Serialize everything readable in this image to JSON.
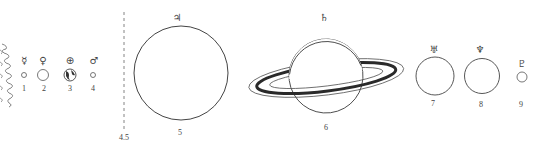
{
  "diagram": {
    "title": "",
    "sun": {
      "edge": "wavy-flame"
    },
    "boundary": {
      "label": "4.5",
      "style": "dashed-vertical"
    },
    "planets": [
      {
        "number": "1",
        "symbol": "☿",
        "name": "Mercury",
        "cx": 24,
        "cy": 75,
        "r": 2.5
      },
      {
        "number": "2",
        "symbol": "♀",
        "name": "Venus",
        "cx": 43,
        "cy": 75,
        "r": 5.5
      },
      {
        "number": "3",
        "symbol": "⊕",
        "name": "Earth",
        "cx": 70,
        "cy": 75,
        "r": 6
      },
      {
        "number": "4",
        "symbol": "♂",
        "name": "Mars",
        "cx": 93,
        "cy": 75,
        "r": 2.5
      },
      {
        "number": "5",
        "symbol": "♃",
        "name": "Jupiter",
        "cx": 181,
        "cy": 73,
        "r": 47
      },
      {
        "number": "6",
        "symbol": "♄",
        "name": "Saturn",
        "cx": 326,
        "cy": 76,
        "r": 37
      },
      {
        "number": "7",
        "symbol": "♅",
        "name": "Uranus",
        "cx": 435,
        "cy": 76,
        "r": 19
      },
      {
        "number": "8",
        "symbol": "♆",
        "name": "Neptune",
        "cx": 482,
        "cy": 76,
        "r": 17.5
      },
      {
        "number": "9",
        "symbol": "♇",
        "name": "Pluto",
        "cx": 522,
        "cy": 77,
        "r": 5
      }
    ]
  },
  "colors": {
    "line": "#555555",
    "ring_dark": "#333333",
    "background": "#ffffff"
  }
}
